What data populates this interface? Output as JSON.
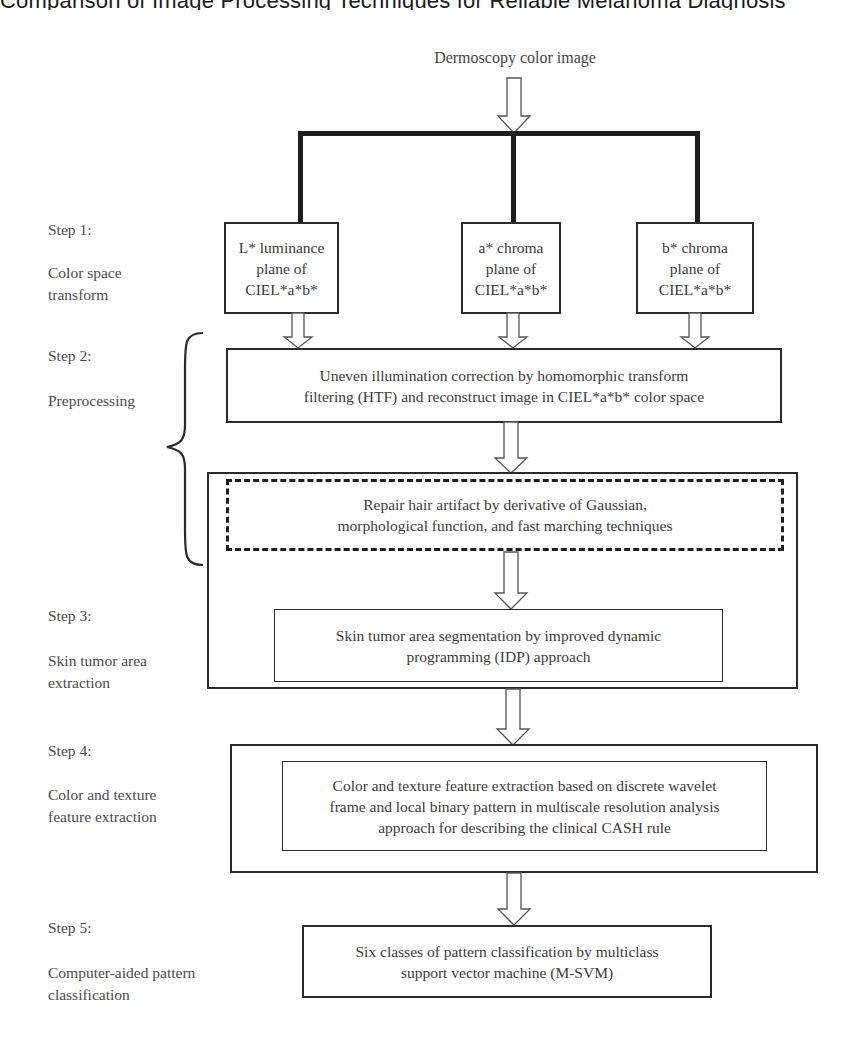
{
  "page": {
    "running_header": "Comparison of Image Processing Techniques for Reliable Melanoma Diagnosis"
  },
  "diagram": {
    "input_label": "Dermoscopy color image",
    "steps": [
      {
        "step": "Step 1:",
        "name_lines": [
          "Color space",
          "transform"
        ],
        "boxes": [
          {
            "lines": [
              "L* luminance",
              "plane of",
              "CIEL*a*b*"
            ]
          },
          {
            "lines": [
              "a* chroma",
              "plane of",
              "CIEL*a*b*"
            ]
          },
          {
            "lines": [
              "b* chroma",
              "plane of",
              "CIEL*a*b*"
            ]
          }
        ]
      },
      {
        "step": "Step 2:",
        "name_lines": [
          "Preprocessing"
        ],
        "boxes": [
          {
            "lines": [
              "Uneven illumination correction by homomorphic transform",
              "filtering (HTF) and reconstruct image in CIEL*a*b* color space"
            ]
          },
          {
            "lines": [
              "Repair hair artifact by derivative of Gaussian,",
              "morphological function, and fast marching techniques"
            ],
            "style": "dashed"
          }
        ]
      },
      {
        "step": "Step 3:",
        "name_lines": [
          "Skin tumor area",
          "extraction"
        ],
        "boxes": [
          {
            "lines": [
              "Skin tumor area segmentation by improved dynamic",
              "programming (IDP) approach"
            ]
          }
        ]
      },
      {
        "step": "Step 4:",
        "name_lines": [
          "Color and texture",
          "feature extraction"
        ],
        "boxes": [
          {
            "lines": [
              "Color and texture feature extraction based on discrete wavelet",
              "frame and local binary pattern in multiscale resolution analysis",
              "approach for describing the clinical CASH rule"
            ]
          }
        ]
      },
      {
        "step": "Step 5:",
        "name_lines": [
          "Computer-aided pattern",
          "classification"
        ],
        "boxes": [
          {
            "lines": [
              "Six classes of pattern classification by multiclass",
              "support vector machine (M-SVM)"
            ]
          }
        ]
      }
    ]
  }
}
